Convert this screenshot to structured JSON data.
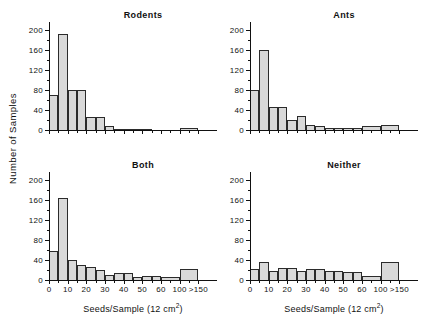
{
  "figure": {
    "y_axis_label": "Number of Samples",
    "x_axis_label_html": "Seeds/Sample (12 cm",
    "x_axis_label_sup": "2",
    "x_axis_label_tail": ")",
    "fill_color": "#d9d9d9",
    "line_color": "#2b2b2b"
  },
  "chart_data": [
    {
      "type": "bar",
      "title": "Rodents",
      "xlabel": "Seeds/Sample (12 cm2)",
      "ylabel": "Number of Samples",
      "xlim": [
        0,
        9
      ],
      "ylim": [
        0,
        215
      ],
      "yticks": [
        0,
        40,
        80,
        120,
        160,
        200
      ],
      "ytick_labels": [
        "0",
        "40",
        "80",
        "120",
        "160",
        "200"
      ],
      "xticks": [
        0,
        1,
        2,
        3,
        4,
        5,
        6,
        7,
        8
      ],
      "xtick_labels": [
        "0",
        "10",
        "20",
        "30",
        "40",
        "50",
        "60",
        "100",
        ">150"
      ],
      "minor_ticks": true,
      "categories": [
        "0-5",
        "5-10",
        "10-15",
        "15-20",
        "20-25",
        "25-30",
        "30-35",
        "35-40",
        "40-45",
        "45-50",
        "50-55",
        "55-60",
        "60-100",
        "100->150"
      ],
      "bin_starts": [
        0.0,
        0.5,
        1.0,
        1.5,
        2.0,
        2.5,
        3.0,
        3.5,
        4.0,
        4.5,
        5.0,
        5.5,
        6.0,
        7.0
      ],
      "bin_widths": [
        0.5,
        0.5,
        0.5,
        0.5,
        0.5,
        0.5,
        0.5,
        0.5,
        0.5,
        0.5,
        0.5,
        0.5,
        1.0,
        1.0
      ],
      "values": [
        70,
        191,
        80,
        80,
        25,
        25,
        8,
        3,
        3,
        2,
        1,
        0,
        0,
        4
      ],
      "grid": false,
      "legend": "none"
    },
    {
      "type": "bar",
      "title": "Ants",
      "xlabel": "Seeds/Sample (12 cm2)",
      "ylabel": "Number of Samples",
      "xlim": [
        0,
        9
      ],
      "ylim": [
        0,
        215
      ],
      "yticks": [
        0,
        40,
        80,
        120,
        160,
        200
      ],
      "ytick_labels": [
        "0",
        "40",
        "80",
        "120",
        "160",
        "200"
      ],
      "xticks": [
        0,
        1,
        2,
        3,
        4,
        5,
        6,
        7,
        8
      ],
      "xtick_labels": [
        "0",
        "10",
        "20",
        "30",
        "40",
        "50",
        "60",
        "100",
        ">150"
      ],
      "minor_ticks": true,
      "categories": [
        "0-5",
        "5-10",
        "10-15",
        "15-20",
        "20-25",
        "25-30",
        "30-35",
        "35-40",
        "40-45",
        "45-50",
        "50-55",
        "55-60",
        "60-100",
        "100->150"
      ],
      "bin_starts": [
        0.0,
        0.5,
        1.0,
        1.5,
        2.0,
        2.5,
        3.0,
        3.5,
        4.0,
        4.5,
        5.0,
        5.5,
        6.0,
        7.0
      ],
      "bin_widths": [
        0.5,
        0.5,
        0.5,
        0.5,
        0.5,
        0.5,
        0.5,
        0.5,
        0.5,
        0.5,
        0.5,
        0.5,
        1.0,
        1.0
      ],
      "values": [
        80,
        160,
        45,
        45,
        20,
        28,
        10,
        8,
        5,
        5,
        4,
        4,
        8,
        10
      ],
      "grid": false,
      "legend": "none"
    },
    {
      "type": "bar",
      "title": "Both",
      "xlabel": "Seeds/Sample (12 cm2)",
      "ylabel": "Number of Samples",
      "xlim": [
        0,
        9
      ],
      "ylim": [
        0,
        215
      ],
      "yticks": [
        0,
        40,
        80,
        120,
        160,
        200
      ],
      "ytick_labels": [
        "0",
        "40",
        "80",
        "120",
        "160",
        "200"
      ],
      "xticks": [
        0,
        1,
        2,
        3,
        4,
        5,
        6,
        7,
        8
      ],
      "xtick_labels": [
        "0",
        "10",
        "20",
        "30",
        "40",
        "50",
        "60",
        "100",
        ">150"
      ],
      "minor_ticks": true,
      "categories": [
        "0-5",
        "5-10",
        "10-15",
        "15-20",
        "20-25",
        "25-30",
        "30-35",
        "35-40",
        "40-45",
        "45-50",
        "50-55",
        "55-60",
        "60-100",
        "100->150"
      ],
      "bin_starts": [
        0.0,
        0.5,
        1.0,
        1.5,
        2.0,
        2.5,
        3.0,
        3.5,
        4.0,
        4.5,
        5.0,
        5.5,
        6.0,
        7.0
      ],
      "bin_widths": [
        0.5,
        0.5,
        0.5,
        0.5,
        0.5,
        0.5,
        0.5,
        0.5,
        0.5,
        0.5,
        0.5,
        0.5,
        1.0,
        1.0
      ],
      "values": [
        58,
        163,
        40,
        30,
        25,
        20,
        10,
        14,
        13,
        6,
        8,
        8,
        6,
        22
      ],
      "grid": false,
      "legend": "none"
    },
    {
      "type": "bar",
      "title": "Neither",
      "xlabel": "Seeds/Sample (12 cm2)",
      "ylabel": "Number of Samples",
      "xlim": [
        0,
        9
      ],
      "ylim": [
        0,
        215
      ],
      "yticks": [
        0,
        40,
        80,
        120,
        160,
        200
      ],
      "ytick_labels": [
        "0",
        "40",
        "80",
        "120",
        "160",
        "200"
      ],
      "xticks": [
        0,
        1,
        2,
        3,
        4,
        5,
        6,
        7,
        8
      ],
      "xtick_labels": [
        "0",
        "10",
        "20",
        "30",
        "40",
        "50",
        "60",
        "100",
        ">150"
      ],
      "minor_ticks": true,
      "categories": [
        "0-5",
        "5-10",
        "10-15",
        "15-20",
        "20-25",
        "25-30",
        "30-35",
        "35-40",
        "40-45",
        "45-50",
        "50-55",
        "55-60",
        "60-100",
        "100->150"
      ],
      "bin_starts": [
        0.0,
        0.5,
        1.0,
        1.5,
        2.0,
        2.5,
        3.0,
        3.5,
        4.0,
        4.5,
        5.0,
        5.5,
        6.0,
        7.0
      ],
      "bin_widths": [
        0.5,
        0.5,
        0.5,
        0.5,
        0.5,
        0.5,
        0.5,
        0.5,
        0.5,
        0.5,
        0.5,
        0.5,
        1.0,
        1.0
      ],
      "values": [
        22,
        35,
        17,
        24,
        24,
        17,
        22,
        22,
        17,
        17,
        16,
        16,
        7,
        36
      ],
      "grid": false,
      "legend": "none"
    }
  ]
}
